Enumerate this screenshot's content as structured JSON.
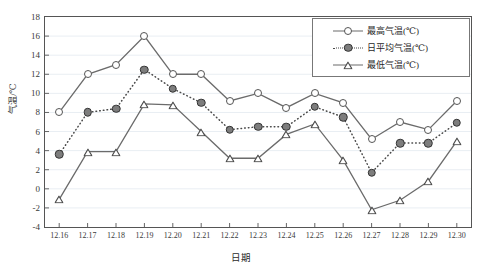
{
  "chart_data": {
    "type": "line",
    "title": "",
    "xlabel": "日期",
    "ylabel": "气温/℃",
    "grid": true,
    "legend_position": "top-right",
    "ylim": [
      -4,
      18
    ],
    "yticks": [
      18,
      16,
      14,
      12,
      10,
      8,
      6,
      4,
      2,
      0,
      -2,
      -4
    ],
    "categories": [
      "12.16",
      "12.17",
      "12.18",
      "12.19",
      "12.20",
      "12.21",
      "12.22",
      "12.23",
      "12.24",
      "12.25",
      "12.26",
      "12.27",
      "12.28",
      "12.29",
      "12.30"
    ],
    "series": [
      {
        "name": "最高气温(℃)",
        "marker": "open-circle",
        "line": "solid",
        "color": "#6b6b6b",
        "values": [
          8,
          12,
          13,
          16,
          12,
          12,
          9.2,
          10,
          8.5,
          10,
          9,
          5.2,
          7,
          6.2,
          9.2
        ]
      },
      {
        "name": "日平均气温(℃)",
        "marker": "filled-circle",
        "line": "dotted",
        "color": "#4a4a4a",
        "values": [
          3.6,
          8,
          8.4,
          12.5,
          10.5,
          9,
          6.2,
          6.5,
          6.5,
          8.6,
          7.5,
          1.7,
          4.8,
          4.8,
          6.9
        ]
      },
      {
        "name": "最低气温(℃)",
        "marker": "open-triangle",
        "line": "solid",
        "color": "#6b6b6b",
        "values": [
          -1.1,
          3.9,
          3.9,
          8.9,
          8.8,
          6,
          3.2,
          3.2,
          5.7,
          6.8,
          3,
          -2.2,
          -1.2,
          0.8,
          5
        ]
      }
    ]
  },
  "axes": {
    "y_title": "气温/℃",
    "x_title": "日期"
  }
}
